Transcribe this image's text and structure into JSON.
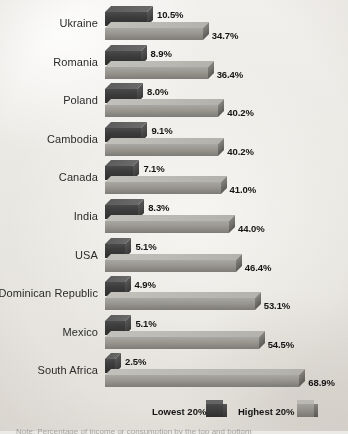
{
  "chart_data": {
    "type": "bar",
    "title": "",
    "xlabel": "",
    "ylabel": "",
    "orientation": "horizontal",
    "grid": false,
    "legend_position": "bottom",
    "categories": [
      "Ukraine",
      "Romania",
      "Poland",
      "Cambodia",
      "Canada",
      "India",
      "USA",
      "Dominican Republic",
      "Mexico",
      "South Africa"
    ],
    "series": [
      {
        "name": "Lowest 20%",
        "color": "#3b3b3b",
        "values": [
          10.5,
          8.9,
          8.0,
          9.1,
          7.1,
          8.3,
          5.1,
          4.9,
          5.1,
          2.5
        ],
        "labels": [
          "10.5%",
          "8.9%",
          "8.0%",
          "9.1%",
          "7.1%",
          "8.3%",
          "5.1%",
          "4.9%",
          "5.1%",
          "2.5%"
        ]
      },
      {
        "name": "Highest 20%",
        "color": "#98968f",
        "values": [
          34.7,
          36.4,
          40.2,
          40.2,
          41.0,
          44.0,
          46.4,
          53.1,
          54.5,
          68.9
        ],
        "labels": [
          "34.7%",
          "36.4%",
          "40.2%",
          "40.2%",
          "41.0%",
          "44.0%",
          "46.4%",
          "53.1%",
          "54.5%",
          "68.9%"
        ]
      }
    ]
  },
  "legend": {
    "lowest_label": "Lowest 20%",
    "highest_label": "Highest 20%"
  },
  "footnote": "Note: Percentage of income or consumption by the top and bottom"
}
